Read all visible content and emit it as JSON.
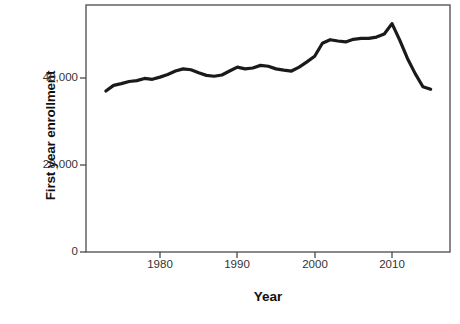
{
  "chart_data": {
    "type": "line",
    "title": "",
    "xlabel": "Year",
    "ylabel": "First year enrollment",
    "xlim": [
      1973,
      2016
    ],
    "ylim": [
      0,
      57000
    ],
    "grid": false,
    "legend": "none",
    "xticks": [
      1980,
      1990,
      2000,
      2010
    ],
    "xtick_labels": [
      "1980",
      "1990",
      "2000",
      "2010"
    ],
    "yticks": [
      0,
      20000,
      40000
    ],
    "ytick_labels": [
      "0",
      "20,000",
      "40,000"
    ],
    "line_color": "#1a1a1a",
    "line_width": 3.2,
    "series": [
      {
        "name": "First year enrollment",
        "x": [
          1973,
          1974,
          1975,
          1976,
          1977,
          1978,
          1979,
          1980,
          1981,
          1982,
          1983,
          1984,
          1985,
          1986,
          1987,
          1988,
          1989,
          1990,
          1991,
          1992,
          1993,
          1994,
          1995,
          1996,
          1997,
          1998,
          1999,
          2000,
          2001,
          2002,
          2003,
          2004,
          2005,
          2006,
          2007,
          2008,
          2009,
          2010,
          2011,
          2012,
          2013,
          2014,
          2015
        ],
        "values": [
          37000,
          38300,
          38700,
          39200,
          39400,
          39900,
          39700,
          40200,
          40800,
          41600,
          42100,
          41900,
          41200,
          40600,
          40400,
          40700,
          41600,
          42500,
          42100,
          42300,
          42900,
          42700,
          42100,
          41800,
          41600,
          42500,
          43700,
          45000,
          48000,
          48800,
          48500,
          48300,
          48900,
          49100,
          49100,
          49400,
          50100,
          52500,
          48700,
          44500,
          41000,
          38000,
          37400
        ]
      }
    ],
    "annotations": []
  },
  "axes": {
    "ytick_positions_px": [
      252,
      165,
      78
    ],
    "plot_box": {
      "left": 86,
      "top": 5,
      "right": 450,
      "bottom": 252
    }
  }
}
